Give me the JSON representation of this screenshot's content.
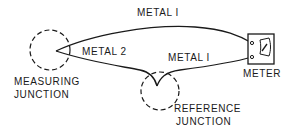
{
  "diagram": {
    "type": "thermocouple-circuit",
    "labels": {
      "metal_top": "METAL I",
      "metal_2": "METAL 2",
      "metal_lower": "METAL I",
      "measuring_line1": "MEASURING",
      "measuring_line2": "JUNCTION",
      "reference_line1": "REFERENCE",
      "reference_line2": "JUNCTION",
      "meter": "METER"
    },
    "colors": {
      "ink": "#1a1a1a",
      "background": "#ffffff"
    }
  }
}
